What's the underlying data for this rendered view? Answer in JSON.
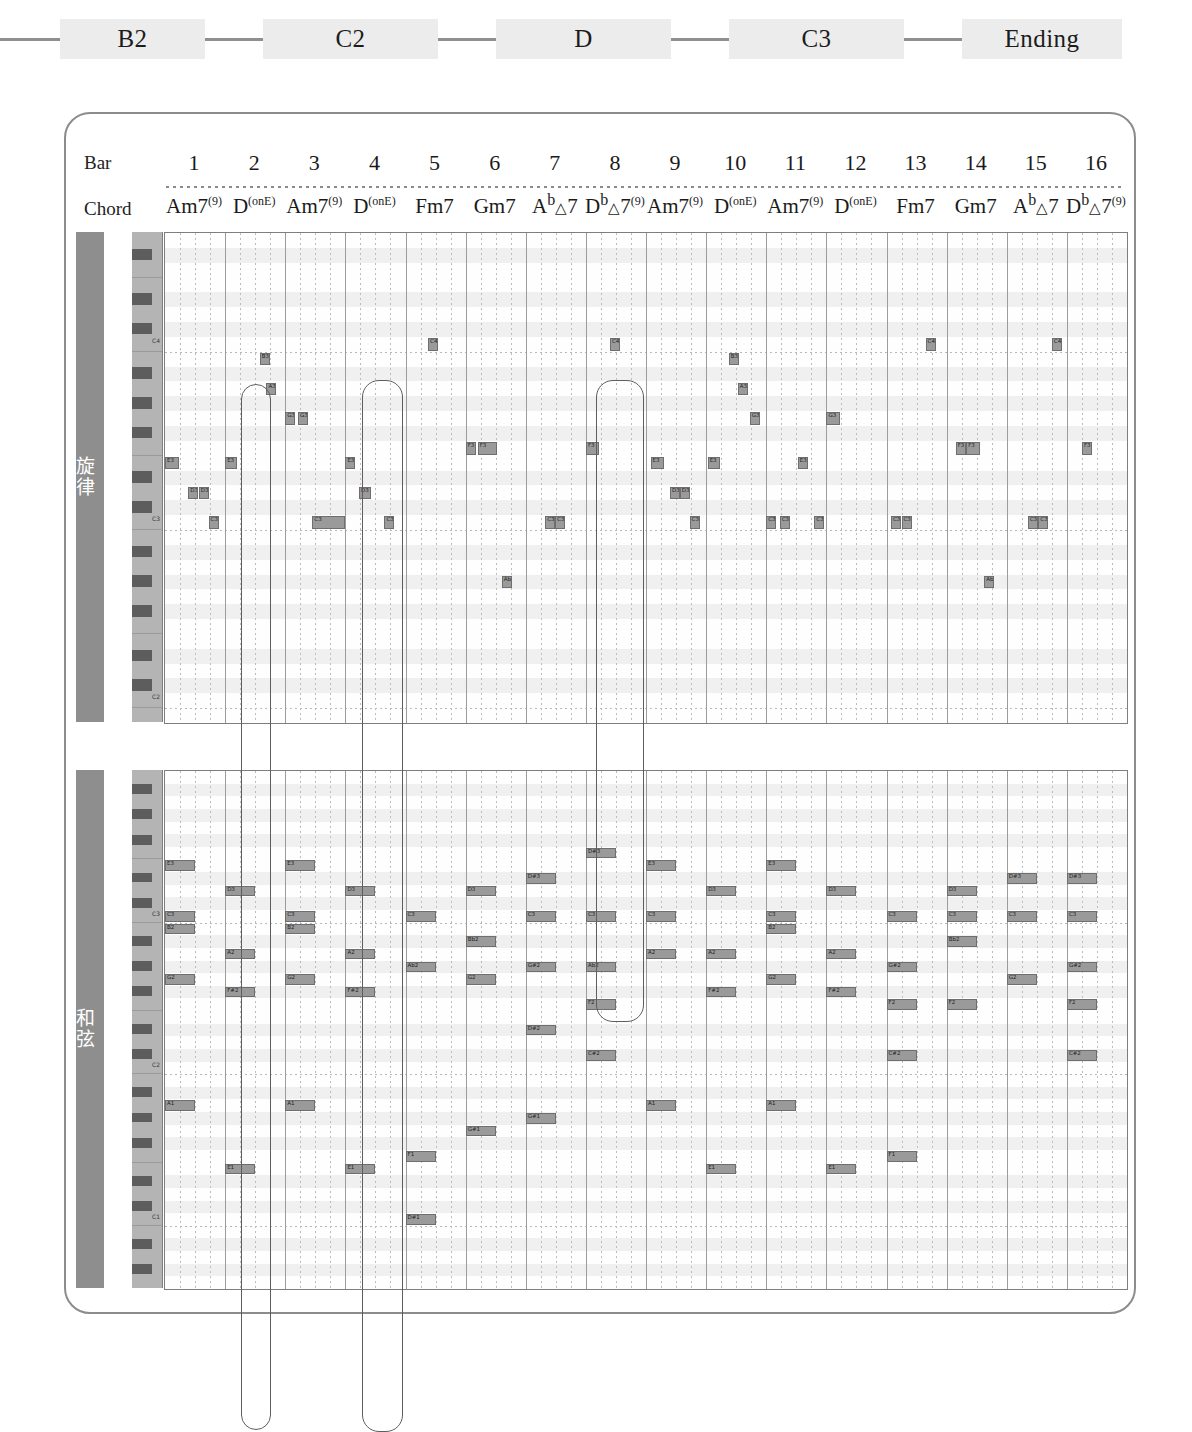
{
  "section_flow": {
    "items": [
      {
        "label": "B2"
      },
      {
        "label": "C2"
      },
      {
        "label": "D"
      },
      {
        "label": "C3"
      },
      {
        "label": "Ending"
      }
    ]
  },
  "header": {
    "bar_label": "Bar",
    "chord_label": "Chord",
    "bars": [
      "1",
      "2",
      "3",
      "4",
      "5",
      "6",
      "7",
      "8",
      "9",
      "10",
      "11",
      "12",
      "13",
      "14",
      "15",
      "16"
    ],
    "chords": [
      {
        "root": "Am7",
        "sup": "(9)",
        "flat": "",
        "tri": false
      },
      {
        "root": "D",
        "sup": "(onE)",
        "flat": "",
        "tri": false
      },
      {
        "root": "Am7",
        "sup": "(9)",
        "flat": "",
        "tri": false
      },
      {
        "root": "D",
        "sup": "(onE)",
        "flat": "",
        "tri": false
      },
      {
        "root": "Fm7",
        "sup": "",
        "flat": "",
        "tri": false
      },
      {
        "root": "Gm7",
        "sup": "",
        "flat": "",
        "tri": false
      },
      {
        "root": "A",
        "sup": "",
        "flat": "b",
        "tri": true,
        "tail": "7"
      },
      {
        "root": "D",
        "sup": "(9)",
        "flat": "b",
        "tri": true,
        "tail": "7"
      },
      {
        "root": "Am7",
        "sup": "(9)",
        "flat": "",
        "tri": false
      },
      {
        "root": "D",
        "sup": "(onE)",
        "flat": "",
        "tri": false
      },
      {
        "root": "Am7",
        "sup": "(9)",
        "flat": "",
        "tri": false
      },
      {
        "root": "D",
        "sup": "(onE)",
        "flat": "",
        "tri": false
      },
      {
        "root": "Fm7",
        "sup": "",
        "flat": "",
        "tri": false
      },
      {
        "root": "Gm7",
        "sup": "",
        "flat": "",
        "tri": false
      },
      {
        "root": "A",
        "sup": "",
        "flat": "b",
        "tri": true,
        "tail": "7"
      },
      {
        "root": "D",
        "sup": "(9)",
        "flat": "b",
        "tri": true,
        "tail": "7"
      }
    ],
    "chord_text": [
      "Am7(9)",
      "D(onE)",
      "Am7(9)",
      "D(onE)",
      "Fm7",
      "Gm7",
      "Ab△7",
      "Db△7(9)",
      "Am7(9)",
      "D(onE)",
      "Am7(9)",
      "D(onE)",
      "Fm7",
      "Gm7",
      "Ab△7",
      "Db△7(9)"
    ]
  },
  "panels": [
    {
      "id": "melody",
      "tab_label": "旋律",
      "octave_labels": [
        "C4",
        "C3",
        "C2"
      ]
    },
    {
      "id": "chord",
      "tab_label": "和弦",
      "octave_labels": [
        "C4",
        "C3",
        "C2",
        "C1"
      ]
    }
  ],
  "colors": {
    "note_fill": "#9a9a9a",
    "note_border": "#6e6e6e",
    "tab": "#8e8e8e",
    "keybed": "#b4b4b4",
    "black_key": "#5d5d5d",
    "frame": "#8c8c8c",
    "chip": "#ececec",
    "flow_line": "#8f8f8f"
  },
  "chart_data": {
    "type": "piano-roll",
    "bars": 16,
    "beats_per_bar": 4,
    "xlabel": "Bar",
    "ylabel": "Pitch",
    "melody": {
      "pitch_range": [
        "C2",
        "F4"
      ],
      "notes": [
        {
          "pitch": "E3",
          "bar": 1,
          "beat": 0.0,
          "len": 0.95,
          "label": "E3"
        },
        {
          "pitch": "D3",
          "bar": 1,
          "beat": 1.55,
          "len": 0.35,
          "label": "D3"
        },
        {
          "pitch": "D3",
          "bar": 1,
          "beat": 2.25,
          "len": 0.35,
          "label": "D3"
        },
        {
          "pitch": "C3",
          "bar": 1,
          "beat": 2.9,
          "len": 0.35,
          "label": "C3"
        },
        {
          "pitch": "E3",
          "bar": 2,
          "beat": 0.0,
          "len": 0.8,
          "label": "E3"
        },
        {
          "pitch": "B3",
          "bar": 2,
          "beat": 2.3,
          "len": 0.35,
          "label": "B3"
        },
        {
          "pitch": "A3",
          "bar": 2,
          "beat": 2.75,
          "len": 0.35,
          "label": "A3"
        },
        {
          "pitch": "G3",
          "bar": 3,
          "beat": 0.0,
          "len": 0.4,
          "label": "G3"
        },
        {
          "pitch": "G3",
          "bar": 3,
          "beat": 0.85,
          "len": 0.5,
          "label": "G3"
        },
        {
          "pitch": "C3",
          "bar": 3,
          "beat": 1.8,
          "len": 2.2,
          "label": "C3"
        },
        {
          "pitch": "E3",
          "bar": 4,
          "beat": 0.0,
          "len": 0.5,
          "label": "E3"
        },
        {
          "pitch": "D3",
          "bar": 4,
          "beat": 0.9,
          "len": 0.8,
          "label": "D3"
        },
        {
          "pitch": "C3",
          "bar": 4,
          "beat": 2.6,
          "len": 0.4,
          "label": "C3"
        },
        {
          "pitch": "C4",
          "bar": 5,
          "beat": 1.5,
          "len": 0.6,
          "label": "C4"
        },
        {
          "pitch": "F3",
          "bar": 6,
          "beat": 0.0,
          "len": 0.5,
          "label": "F3"
        },
        {
          "pitch": "F3",
          "bar": 6,
          "beat": 0.8,
          "len": 1.3,
          "label": "F3"
        },
        {
          "pitch": "Ab2",
          "bar": 6,
          "beat": 2.4,
          "len": 0.5,
          "label": "Ab2"
        },
        {
          "pitch": "C3",
          "bar": 7,
          "beat": 1.3,
          "len": 0.4,
          "label": "C3"
        },
        {
          "pitch": "C3",
          "bar": 7,
          "beat": 1.95,
          "len": 0.6,
          "label": "C3"
        },
        {
          "pitch": "F3",
          "bar": 8,
          "beat": 0.0,
          "len": 0.9,
          "label": "F3"
        },
        {
          "pitch": "C4",
          "bar": 8,
          "beat": 1.6,
          "len": 0.5,
          "label": "C4"
        },
        {
          "pitch": "E3",
          "bar": 9,
          "beat": 0.3,
          "len": 0.9,
          "label": "E3"
        },
        {
          "pitch": "D3",
          "bar": 9,
          "beat": 1.6,
          "len": 0.35,
          "label": "D3"
        },
        {
          "pitch": "D3",
          "bar": 9,
          "beat": 2.25,
          "len": 0.35,
          "label": "D3"
        },
        {
          "pitch": "C3",
          "bar": 9,
          "beat": 2.9,
          "len": 0.3,
          "label": "C3"
        },
        {
          "pitch": "E3",
          "bar": 10,
          "beat": 0.1,
          "len": 0.8,
          "label": "E3"
        },
        {
          "pitch": "B3",
          "bar": 10,
          "beat": 1.5,
          "len": 0.4,
          "label": "B3"
        },
        {
          "pitch": "A3",
          "bar": 10,
          "beat": 2.1,
          "len": 0.4,
          "label": "A3"
        },
        {
          "pitch": "G3",
          "bar": 10,
          "beat": 2.9,
          "len": 0.4,
          "label": "G3"
        },
        {
          "pitch": "C3",
          "bar": 11,
          "beat": 0.0,
          "len": 0.45,
          "label": "C3"
        },
        {
          "pitch": "C3",
          "bar": 11,
          "beat": 0.9,
          "len": 0.4,
          "label": "C3"
        },
        {
          "pitch": "E3",
          "bar": 11,
          "beat": 2.1,
          "len": 0.45,
          "label": "E3"
        },
        {
          "pitch": "G3",
          "bar": 12,
          "beat": 0.0,
          "len": 0.9,
          "label": "G3"
        },
        {
          "pitch": "C3",
          "bar": 11,
          "beat": 3.2,
          "len": 0.35,
          "label": "C3"
        },
        {
          "pitch": "C3",
          "bar": 13,
          "beat": 0.3,
          "len": 0.5,
          "label": "C3"
        },
        {
          "pitch": "C3",
          "bar": 13,
          "beat": 1.0,
          "len": 0.5,
          "label": "C3"
        },
        {
          "pitch": "C4",
          "bar": 13,
          "beat": 2.6,
          "len": 0.5,
          "label": "C4"
        },
        {
          "pitch": "F3",
          "bar": 14,
          "beat": 0.6,
          "len": 0.45,
          "label": "F3"
        },
        {
          "pitch": "F3",
          "bar": 14,
          "beat": 1.3,
          "len": 0.9,
          "label": "F3"
        },
        {
          "pitch": "Ab2",
          "bar": 14,
          "beat": 2.5,
          "len": 0.5,
          "label": "Ab2"
        },
        {
          "pitch": "C3",
          "bar": 15,
          "beat": 1.4,
          "len": 0.45,
          "label": "C3"
        },
        {
          "pitch": "C3",
          "bar": 15,
          "beat": 2.1,
          "len": 0.5,
          "label": "C3"
        },
        {
          "pitch": "C4",
          "bar": 15,
          "beat": 3.0,
          "len": 0.6,
          "label": "C4"
        },
        {
          "pitch": "F3",
          "bar": 16,
          "beat": 1.0,
          "len": 0.7,
          "label": "F3"
        }
      ]
    },
    "chords": {
      "pitch_range": [
        "C1",
        "F3"
      ],
      "notes": [
        {
          "pitch": "E3",
          "bar": 1,
          "beat": 0,
          "len": 2,
          "label": "E3"
        },
        {
          "pitch": "C3",
          "bar": 1,
          "beat": 0,
          "len": 2,
          "label": "C3"
        },
        {
          "pitch": "B2",
          "bar": 1,
          "beat": 0,
          "len": 2,
          "label": "B2"
        },
        {
          "pitch": "G2",
          "bar": 1,
          "beat": 0,
          "len": 2,
          "label": "G2"
        },
        {
          "pitch": "A1",
          "bar": 1,
          "beat": 0,
          "len": 2,
          "label": "A1"
        },
        {
          "pitch": "D3",
          "bar": 2,
          "beat": 0,
          "len": 2,
          "label": "D3"
        },
        {
          "pitch": "A2",
          "bar": 2,
          "beat": 0,
          "len": 2,
          "label": "A2"
        },
        {
          "pitch": "F#2",
          "bar": 2,
          "beat": 0,
          "len": 2,
          "label": "F#2"
        },
        {
          "pitch": "E1",
          "bar": 2,
          "beat": 0,
          "len": 2,
          "label": "E1"
        },
        {
          "pitch": "E3",
          "bar": 3,
          "beat": 0,
          "len": 2,
          "label": "E3"
        },
        {
          "pitch": "C3",
          "bar": 3,
          "beat": 0,
          "len": 2,
          "label": "C3"
        },
        {
          "pitch": "B2",
          "bar": 3,
          "beat": 0,
          "len": 2,
          "label": "B2"
        },
        {
          "pitch": "G2",
          "bar": 3,
          "beat": 0,
          "len": 2,
          "label": "G2"
        },
        {
          "pitch": "A1",
          "bar": 3,
          "beat": 0,
          "len": 2,
          "label": "A1"
        },
        {
          "pitch": "D3",
          "bar": 4,
          "beat": 0,
          "len": 2,
          "label": "D3"
        },
        {
          "pitch": "A2",
          "bar": 4,
          "beat": 0,
          "len": 2,
          "label": "A2"
        },
        {
          "pitch": "F#2",
          "bar": 4,
          "beat": 0,
          "len": 2,
          "label": "F#2"
        },
        {
          "pitch": "E1",
          "bar": 4,
          "beat": 0,
          "len": 2,
          "label": "E1"
        },
        {
          "pitch": "C3",
          "bar": 5,
          "beat": 0,
          "len": 2,
          "label": "C3"
        },
        {
          "pitch": "Ab2",
          "bar": 5,
          "beat": 0,
          "len": 2,
          "label": "Ab2"
        },
        {
          "pitch": "C1",
          "bar": 5,
          "beat": 0,
          "len": 2,
          "label": "D#1"
        },
        {
          "pitch": "F1",
          "bar": 5,
          "beat": 0,
          "len": 2,
          "label": "F1"
        },
        {
          "pitch": "D3",
          "bar": 6,
          "beat": 0,
          "len": 2,
          "label": "D3"
        },
        {
          "pitch": "Bb2",
          "bar": 6,
          "beat": 0,
          "len": 2,
          "label": "Bb2"
        },
        {
          "pitch": "G2",
          "bar": 6,
          "beat": 0,
          "len": 2,
          "label": "G2"
        },
        {
          "pitch": "G1",
          "bar": 6,
          "beat": 0,
          "len": 2,
          "label": "G#1"
        },
        {
          "pitch": "Eb3",
          "bar": 7,
          "beat": 0,
          "len": 2,
          "label": "D#3"
        },
        {
          "pitch": "C3",
          "bar": 7,
          "beat": 0,
          "len": 2,
          "label": "C3"
        },
        {
          "pitch": "Ab2",
          "bar": 7,
          "beat": 0,
          "len": 2,
          "label": "G#2"
        },
        {
          "pitch": "Eb2",
          "bar": 7,
          "beat": 0,
          "len": 2,
          "label": "D#2"
        },
        {
          "pitch": "Ab1",
          "bar": 7,
          "beat": 0,
          "len": 2,
          "label": "G#1"
        },
        {
          "pitch": "F3",
          "bar": 8,
          "beat": 0,
          "len": 2,
          "label": "D#3"
        },
        {
          "pitch": "C3",
          "bar": 8,
          "beat": 0,
          "len": 2,
          "label": "C3"
        },
        {
          "pitch": "Ab2",
          "bar": 8,
          "beat": 0,
          "len": 2,
          "label": "Ab2"
        },
        {
          "pitch": "F2",
          "bar": 8,
          "beat": 0,
          "len": 2,
          "label": "F2"
        },
        {
          "pitch": "Db2",
          "bar": 8,
          "beat": 0,
          "len": 2,
          "label": "C#2"
        },
        {
          "pitch": "E3",
          "bar": 9,
          "beat": 0,
          "len": 2,
          "label": "E3"
        },
        {
          "pitch": "C3",
          "bar": 9,
          "beat": 0,
          "len": 2,
          "label": "C3"
        },
        {
          "pitch": "A2",
          "bar": 9,
          "beat": 0,
          "len": 2,
          "label": "A2"
        },
        {
          "pitch": "A1",
          "bar": 9,
          "beat": 0,
          "len": 2,
          "label": "A1"
        },
        {
          "pitch": "D3",
          "bar": 10,
          "beat": 0,
          "len": 2,
          "label": "D3"
        },
        {
          "pitch": "A2",
          "bar": 10,
          "beat": 0,
          "len": 2,
          "label": "A2"
        },
        {
          "pitch": "F#2",
          "bar": 10,
          "beat": 0,
          "len": 2,
          "label": "F#2"
        },
        {
          "pitch": "E1",
          "bar": 10,
          "beat": 0,
          "len": 2,
          "label": "E1"
        },
        {
          "pitch": "E3",
          "bar": 11,
          "beat": 0,
          "len": 2,
          "label": "E3"
        },
        {
          "pitch": "C3",
          "bar": 11,
          "beat": 0,
          "len": 2,
          "label": "C3"
        },
        {
          "pitch": "B2",
          "bar": 11,
          "beat": 0,
          "len": 2,
          "label": "B2"
        },
        {
          "pitch": "G2",
          "bar": 11,
          "beat": 0,
          "len": 2,
          "label": "G2"
        },
        {
          "pitch": "A1",
          "bar": 11,
          "beat": 0,
          "len": 2,
          "label": "A1"
        },
        {
          "pitch": "D3",
          "bar": 12,
          "beat": 0,
          "len": 2,
          "label": "D3"
        },
        {
          "pitch": "A2",
          "bar": 12,
          "beat": 0,
          "len": 2,
          "label": "A2"
        },
        {
          "pitch": "F#2",
          "bar": 12,
          "beat": 0,
          "len": 2,
          "label": "F#2"
        },
        {
          "pitch": "E1",
          "bar": 12,
          "beat": 0,
          "len": 2,
          "label": "E1"
        },
        {
          "pitch": "C3",
          "bar": 13,
          "beat": 0,
          "len": 2,
          "label": "C3"
        },
        {
          "pitch": "Ab2",
          "bar": 13,
          "beat": 0,
          "len": 2,
          "label": "G#2"
        },
        {
          "pitch": "F2",
          "bar": 13,
          "beat": 0,
          "len": 2,
          "label": "F2"
        },
        {
          "pitch": "Db2",
          "bar": 13,
          "beat": 0,
          "len": 2,
          "label": "C#2"
        },
        {
          "pitch": "F1",
          "bar": 13,
          "beat": 0,
          "len": 2,
          "label": "F1"
        },
        {
          "pitch": "D3",
          "bar": 14,
          "beat": 0,
          "len": 2,
          "label": "D3"
        },
        {
          "pitch": "C3",
          "bar": 14,
          "beat": 0,
          "len": 2,
          "label": "C3"
        },
        {
          "pitch": "Bb2",
          "bar": 14,
          "beat": 0,
          "len": 2,
          "label": "Bb2"
        },
        {
          "pitch": "F2",
          "bar": 14,
          "beat": 0,
          "len": 2,
          "label": "F2"
        },
        {
          "pitch": "Eb3",
          "bar": 15,
          "beat": 0,
          "len": 2,
          "label": "D#3"
        },
        {
          "pitch": "C3",
          "bar": 15,
          "beat": 0,
          "len": 2,
          "label": "C3"
        },
        {
          "pitch": "G2",
          "bar": 15,
          "beat": 0,
          "len": 2,
          "label": "G2"
        },
        {
          "pitch": "Eb3",
          "bar": 16,
          "beat": 0,
          "len": 2,
          "label": "D#3"
        },
        {
          "pitch": "C3",
          "bar": 16,
          "beat": 0,
          "len": 2,
          "label": "C3"
        },
        {
          "pitch": "Ab2",
          "bar": 16,
          "beat": 0,
          "len": 2,
          "label": "G#2"
        },
        {
          "pitch": "F2",
          "bar": 16,
          "beat": 0,
          "len": 2,
          "label": "F2"
        },
        {
          "pitch": "Db2",
          "bar": 16,
          "beat": 0,
          "len": 2,
          "label": "C#2"
        }
      ]
    },
    "annotations": [
      {
        "name": "capsule-bar2",
        "bar_start": 2,
        "bar_end": 2
      },
      {
        "name": "capsule-bar4",
        "bar_start": 4,
        "bar_end": 4
      },
      {
        "name": "capsule-bar8",
        "bar_start": 8,
        "bar_end": 8
      }
    ]
  }
}
